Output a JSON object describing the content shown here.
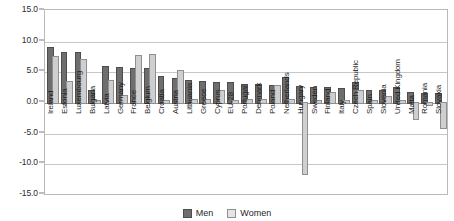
{
  "legend": {
    "position": "bottom",
    "items": [
      {
        "label": "Men",
        "name": "men",
        "color": "#6e6e6e"
      },
      {
        "label": "Women",
        "name": "women",
        "color": "#e4e4e4"
      }
    ]
  },
  "axis": {
    "yticks": [
      "15.0",
      "10.0",
      "5.0",
      "0.0",
      "-5.0",
      "-10.0",
      "-15.0"
    ]
  },
  "chart_data": {
    "type": "bar",
    "title": "",
    "subtitle": "",
    "xlabel": "",
    "ylabel": "",
    "ylim": [
      -15.0,
      15.0
    ],
    "ytick_values": [
      15.0,
      10.0,
      5.0,
      0.0,
      -5.0,
      -10.0,
      -15.0
    ],
    "grid": true,
    "legend_position": "bottom",
    "categories": [
      "Ireland",
      "Estonia",
      "Luxembourg",
      "Bulgaria",
      "Latvia",
      "Germany",
      "France",
      "Belgium",
      "Croatia",
      "Austria",
      "Lithuania",
      "Greece",
      "Cyprus",
      "EU-28",
      "Portugal",
      "Denmark",
      "Poland",
      "Netherlands",
      "Hungary",
      "Sweden",
      "Finland",
      "Italy",
      "Czech Republic",
      "Spain",
      "Slovenia",
      "United Kingdom",
      "Malta",
      "Romania",
      "Slovakia"
    ],
    "series": [
      {
        "name": "Men",
        "color": "#6e6e6e",
        "values": [
          9.0,
          8.2,
          8.1,
          2.0,
          5.8,
          5.7,
          5.6,
          5.5,
          4.2,
          3.9,
          3.6,
          3.4,
          3.3,
          3.2,
          3.0,
          2.9,
          2.8,
          4.0,
          2.6,
          2.5,
          2.4,
          2.3,
          3.3,
          2.0,
          1.9,
          2.4,
          1.6,
          1.5,
          1.4
        ]
      },
      {
        "name": "Women",
        "color": "#e4e4e4",
        "values": [
          7.5,
          3.4,
          7.0,
          0.3,
          3.6,
          1.1,
          7.6,
          7.8,
          0.4,
          5.2,
          0.5,
          0.5,
          2.0,
          0.4,
          0.5,
          0.5,
          2.8,
          0.5,
          -11.5,
          0.4,
          1.6,
          0.4,
          2.0,
          0.4,
          1.0,
          0.3,
          -2.6,
          -0.3,
          -4.0
        ]
      }
    ]
  }
}
